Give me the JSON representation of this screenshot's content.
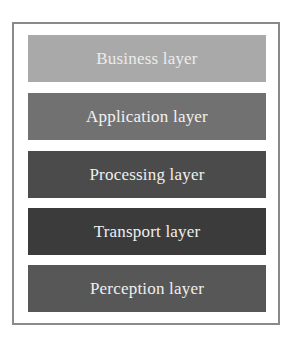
{
  "diagram": {
    "type": "layered-stack",
    "layers": [
      {
        "label": "Business layer",
        "fill": "#a9a9a9",
        "text_color": "#ececec"
      },
      {
        "label": "Application layer",
        "fill": "#717171",
        "text_color": "#f2f2f2"
      },
      {
        "label": "Processing layer",
        "fill": "#4b4b4b",
        "text_color": "#efefef"
      },
      {
        "label": "Transport layer",
        "fill": "#3b3b3b",
        "text_color": "#efefef"
      },
      {
        "label": "Perception layer",
        "fill": "#575757",
        "text_color": "#efefef"
      }
    ],
    "frame_border": "#8a8a8a"
  }
}
